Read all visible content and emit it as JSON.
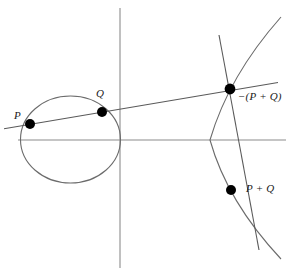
{
  "figure": {
    "colors": {
      "axis": "#8c8c8c",
      "curve": "#6b6b6b",
      "line": "#5a5a5a",
      "point": "#000000",
      "label": "#1a1a1a",
      "background": "#ffffff"
    },
    "geometry": {
      "width": 291,
      "height": 278,
      "origin": {
        "x": 120,
        "y": 140
      },
      "x_axis": {
        "x1": 18,
        "y1": 140,
        "x2": 286,
        "y2": 140
      },
      "y_axis": {
        "x1": 120,
        "y1": 8,
        "x2": 120,
        "y2": 268
      },
      "oval": {
        "cx": 70.5,
        "cy": 139.5,
        "rx": 50,
        "ry": 43.5
      },
      "branch_vertex": {
        "x": 210,
        "y": 140
      },
      "branch_top": {
        "x": 281,
        "y": 17
      },
      "branch_bottom": {
        "x": 281,
        "y": 259
      },
      "secant": {
        "x1": 4,
        "y1": 128.5,
        "x2": 278,
        "y2": 82.5
      },
      "reflection_segment": {
        "x1": 230,
        "y1": 89,
        "x2": 231,
        "y2": 190
      }
    },
    "points": [
      {
        "id": "P",
        "label": "P",
        "x": 30,
        "y": 124,
        "r": 5.0,
        "label_pos": {
          "x": 14,
          "y": 110
        }
      },
      {
        "id": "Q",
        "label": "Q",
        "x": 102,
        "y": 112,
        "r": 5.0,
        "label_pos": {
          "x": 96,
          "y": 88
        }
      },
      {
        "id": "minusPQ",
        "label": "−(P + Q)",
        "x": 230,
        "y": 89,
        "r": 5.4,
        "label_pos": {
          "x": 238,
          "y": 91
        }
      },
      {
        "id": "PQ",
        "label": "P + Q",
        "x": 231,
        "y": 190,
        "r": 5.0,
        "label_pos": {
          "x": 246,
          "y": 183
        }
      }
    ],
    "labels": {
      "p": "P",
      "q": "Q",
      "minus_p_plus_q": "−(P + Q)",
      "p_plus_q": "P + Q"
    }
  }
}
